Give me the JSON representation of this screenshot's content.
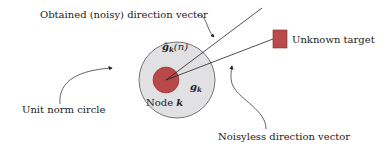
{
  "diagram": {
    "labels": {
      "noisy_vector": "Obtained (noisy) direction vector",
      "unknown_target": "Unknown target",
      "unit_norm_circle": "Unit norm circle",
      "noiseless_vector": "Noisyless direction vector",
      "node": "Node ",
      "node_var": "k",
      "g_hat": "ĝ",
      "g_hat_sub": "k",
      "g_hat_arg": "(n)",
      "g": "g",
      "g_sub": "k"
    },
    "colors": {
      "unit_circle_fill": "#e1e1e3",
      "unit_circle_stroke": "#555555",
      "node_fill": "#b9484a",
      "node_stroke": "#8a2e30",
      "target_fill": "#bb4a4a",
      "target_stroke": "#7a2a2a",
      "line": "#222222"
    }
  }
}
